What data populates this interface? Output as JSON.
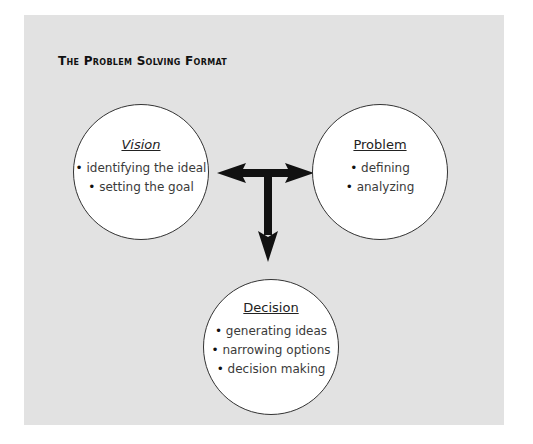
{
  "title": "The Problem Solving Format",
  "colors": {
    "panel_background": "#e2e2e2",
    "circle_fill": "#ffffff",
    "arrow": "#111111"
  },
  "nodes": {
    "vision": {
      "heading": "Vision",
      "items": [
        "identifying the ideal",
        "setting the goal"
      ]
    },
    "problem": {
      "heading": "Problem",
      "items": [
        "defining",
        "analyzing"
      ]
    },
    "decision": {
      "heading": "Decision",
      "items": [
        "generating ideas",
        "narrowing options",
        "decision making"
      ]
    }
  },
  "connectors": [
    {
      "from": "vision",
      "to": "problem",
      "type": "double-headed-arrow"
    },
    {
      "from": "vision-problem-link",
      "to": "decision",
      "type": "arrow-down"
    }
  ]
}
